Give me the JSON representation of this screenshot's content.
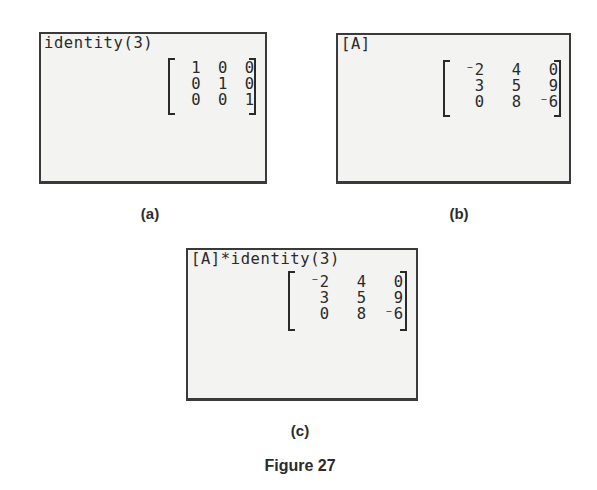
{
  "panels": {
    "a": {
      "label": "(a)",
      "command": "identity(3)",
      "matrix": [
        [
          "1",
          "0",
          "0"
        ],
        [
          "0",
          "1",
          "0"
        ],
        [
          "0",
          "0",
          "1"
        ]
      ]
    },
    "b": {
      "label": "(b)",
      "command": "[A]",
      "matrix": [
        [
          "⁻2",
          "4",
          "0"
        ],
        [
          "3",
          "5",
          "9"
        ],
        [
          "0",
          "8",
          "⁻6"
        ]
      ]
    },
    "c": {
      "label": "(c)",
      "command": "[A]*identity(3)",
      "matrix": [
        [
          "⁻2",
          "4",
          "0"
        ],
        [
          "3",
          "5",
          "9"
        ],
        [
          "0",
          "8",
          "⁻6"
        ]
      ]
    }
  },
  "caption": "Figure 27"
}
